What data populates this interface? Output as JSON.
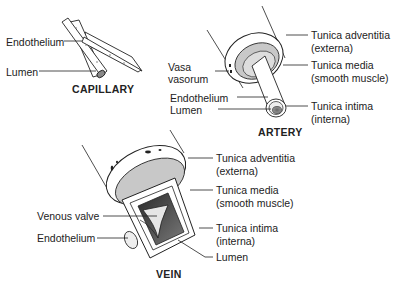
{
  "capillary": {
    "title": "CAPILLARY",
    "labels": {
      "endothelium": "Endothelium",
      "lumen": "Lumen"
    }
  },
  "artery": {
    "title": "ARTERY",
    "labels": {
      "vasa_line1": "Vasa",
      "vasa_line2": "vasorum",
      "endothelium": "Endothelium",
      "lumen": "Lumen",
      "adventitia_line1": "Tunica adventitia",
      "adventitia_line2": "(externa)",
      "media_line1": "Tunica media",
      "media_line2": "(smooth muscle)",
      "intima_line1": "Tunica intima",
      "intima_line2": "(interna)"
    }
  },
  "vein": {
    "title": "VEIN",
    "labels": {
      "venous_valve": "Venous valve",
      "endothelium": "Endothelium",
      "adventitia_line1": "Tunica adventitia",
      "adventitia_line2": "(externa)",
      "media_line1": "Tunica media",
      "media_line2": "(smooth muscle)",
      "intima_line1": "Tunica intima",
      "intima_line2": "(interna)",
      "lumen": "Lumen"
    }
  },
  "colors": {
    "line": "#222222",
    "media_gray": "#c8c8c8",
    "lumen_dark": "#4a4a4a",
    "background": "#ffffff"
  }
}
